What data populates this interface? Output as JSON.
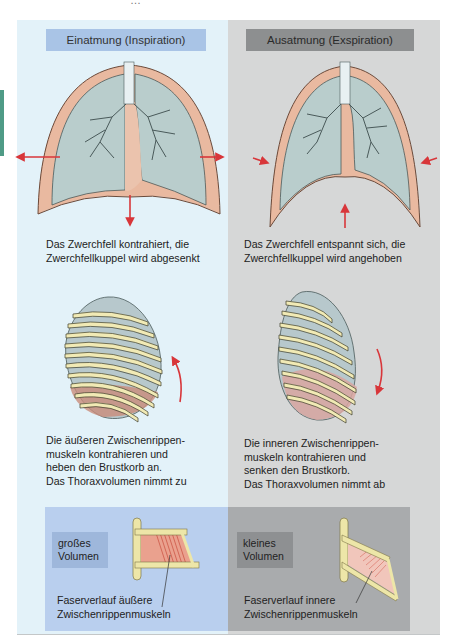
{
  "page": {
    "running_header": "…"
  },
  "colors": {
    "inspiration_panel": "#e3f2f9",
    "expiration_panel": "#d6d7d7",
    "inspiration_header": "#a9c4e6",
    "expiration_header": "#8d8f90",
    "arrow_red": "#d8363a",
    "lung": "#b9cdcc",
    "pleura": "#e9b9a0",
    "rib": "#f1eab5",
    "side_tab": "#4f9b86"
  },
  "columns": [
    {
      "id": "inspiration",
      "title": "Einatmung (Inspiration)",
      "lung_caption": "Das Zwerchfell kontrahiert, die\nZwerchfellkuppel wird abgesenkt",
      "thorax_caption": "Die äußeren Zwischenrippen-\nmuskeln kontrahieren und\nheben den Brustkorb an.\nDas Thoraxvolumen nimmt zu",
      "diaphragm_arrow": "down",
      "chest_arrows": "outward",
      "rib_arrow": "up",
      "volume_label": "großes\nVolumen",
      "fiber_caption": "Faserverlauf äußere\nZwischenrippenmuskeln"
    },
    {
      "id": "expiration",
      "title": "Ausatmung (Exspiration)",
      "lung_caption": "Das Zwerchfell entspannt sich, die\nZwerchfellkuppel wird angehoben",
      "thorax_caption": "Die inneren Zwischenrippen-\nmuskeln kontrahieren und\nsenken den Brustkorb.\nDas Thoraxvolumen nimmt ab",
      "diaphragm_arrow": "up",
      "chest_arrows": "inward",
      "rib_arrow": "down",
      "volume_label": "kleines\nVolumen",
      "fiber_caption": "Faserverlauf innere\nZwischenrippenmuskeln"
    }
  ]
}
